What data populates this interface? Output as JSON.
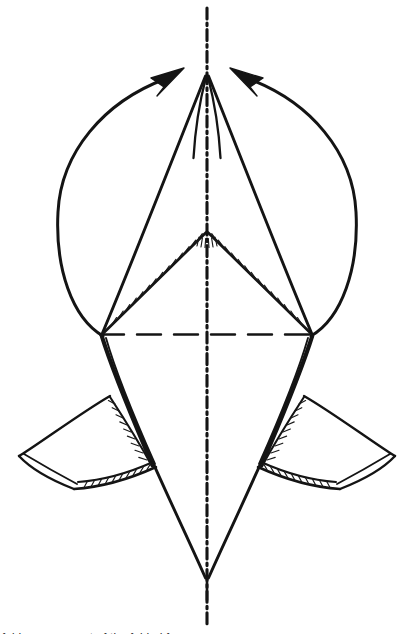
{
  "figure": {
    "kind": "technical-line-drawing",
    "background_color": "#ffffff",
    "ink_color": "#141414",
    "canvas": {
      "width": 408,
      "height": 634
    },
    "caption": {
      "visible_fragment": "foldng movement of the folded form",
      "note": "clipped at bottom edge"
    },
    "symmetry": {
      "axis_label": "vertical centre line",
      "axis_x": 207,
      "line_style": "dash-dot"
    },
    "guides": [
      {
        "name": "vertical-centerline",
        "style": "dash-dot",
        "x": 207,
        "y_start": 8,
        "y_end": 626
      },
      {
        "name": "horizontal-axis",
        "style": "dashed",
        "y": 334,
        "x_start": 100,
        "x_end": 313
      }
    ],
    "vertices": {
      "top_apex": {
        "x": 207,
        "y": 75
      },
      "upper_fold_apex": {
        "x": 207,
        "y": 232
      },
      "left_hinge": {
        "x": 102,
        "y": 334
      },
      "right_hinge": {
        "x": 312,
        "y": 334
      },
      "bottom_point": {
        "x": 207,
        "y": 580
      },
      "left_wing_tip": {
        "x": 20,
        "y": 456
      },
      "right_wing_tip": {
        "x": 394,
        "y": 456
      }
    },
    "arrows": [
      {
        "name": "left-motion-arrow",
        "direction": "counter-clockwise, upward-inward",
        "tip": {
          "x": 172,
          "y": 73
        },
        "tail": {
          "x": 103,
          "y": 336
        },
        "bulge_x": 55
      },
      {
        "name": "right-motion-arrow",
        "direction": "clockwise, upward-inward",
        "tip": {
          "x": 242,
          "y": 73
        },
        "tail": {
          "x": 311,
          "y": 336
        },
        "bulge_x": 356
      }
    ],
    "hatched_edges": [
      "upper-left-fold-edge",
      "upper-right-fold-edge",
      "left-spar-edge",
      "right-spar-edge",
      "left-wing-spar",
      "right-wing-spar"
    ]
  }
}
